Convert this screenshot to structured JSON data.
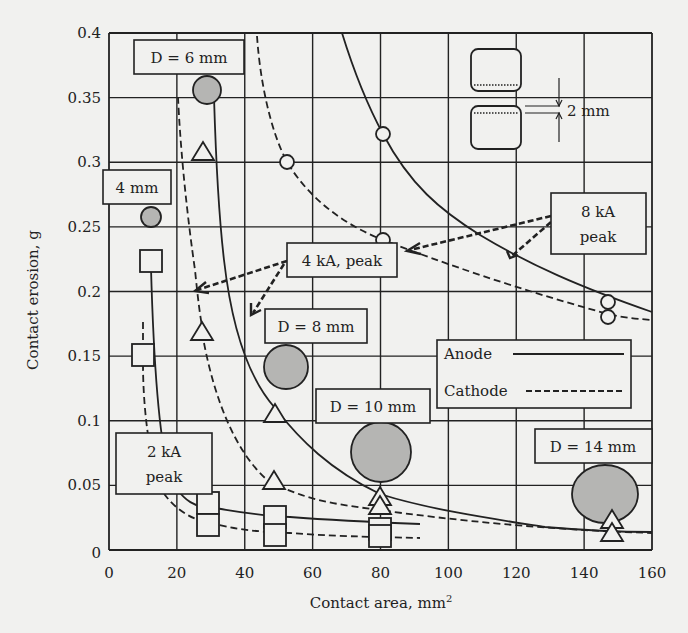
{
  "chart_data": {
    "type": "scatter",
    "title": "",
    "xlabel": "Contact area, mm²",
    "xlabel_main": "Contact area, mm",
    "xlabel_sup": "2",
    "ylabel": "Contact erosion, g",
    "xlim": [
      0,
      160
    ],
    "ylim": [
      0,
      0.4
    ],
    "grid": true,
    "x_ticks": [
      0,
      20,
      40,
      60,
      80,
      100,
      120,
      140,
      160
    ],
    "x_tick_labels": [
      "0",
      "20",
      "40",
      "60",
      "80",
      "100",
      "120",
      "140",
      "160"
    ],
    "y_ticks": [
      0,
      0.05,
      0.1,
      0.15,
      0.2,
      0.25,
      0.3,
      0.35,
      0.4
    ],
    "y_tick_labels": [
      "0",
      "0.05",
      "0.1",
      "0.15",
      "0.2",
      "0.25",
      "0.3",
      "0.35",
      "0.4"
    ],
    "legend": {
      "position": "center-right",
      "entries": [
        {
          "label": "Anode",
          "style": "solid"
        },
        {
          "label": "Cathode",
          "style": "dashed"
        }
      ]
    },
    "series": [
      {
        "name": "2 kA peak, Anode",
        "marker": "square",
        "line": "solid",
        "points": [
          [
            12.5,
            0.222
          ],
          [
            29,
            0.036
          ],
          [
            49,
            0.027
          ],
          [
            80,
            0.022
          ]
        ]
      },
      {
        "name": "2 kA peak, Cathode",
        "marker": "square",
        "line": "dashed",
        "points": [
          [
            10,
            0.15
          ],
          [
            29,
            0.019
          ],
          [
            49,
            0.013
          ],
          [
            80,
            0.012
          ]
        ]
      },
      {
        "name": "4 kA peak, Anode",
        "marker": "triangle",
        "line": "solid",
        "points": [
          [
            27.5,
            0.305
          ],
          [
            49,
            0.104
          ],
          [
            80,
            0.038
          ],
          [
            147,
            0.022
          ]
        ]
      },
      {
        "name": "4 kA peak, Cathode",
        "marker": "triangle",
        "line": "dashed",
        "points": [
          [
            27.5,
            0.167
          ],
          [
            48.5,
            0.052
          ],
          [
            80,
            0.032
          ],
          [
            147,
            0.012
          ]
        ]
      },
      {
        "name": "8 kA peak, Anode",
        "marker": "circle-open",
        "line": "solid",
        "points": [
          [
            80,
            0.32
          ],
          [
            147,
            0.19
          ]
        ]
      },
      {
        "name": "8 kA peak, Cathode",
        "marker": "circle-open",
        "line": "dashed",
        "points": [
          [
            52,
            0.298
          ],
          [
            80,
            0.24
          ],
          [
            147,
            0.18
          ]
        ]
      },
      {
        "name": "Electrode diameter markers",
        "marker": "circle-filled-gray",
        "points": [
          {
            "label": "4 mm",
            "x": 12.5,
            "y": 0.256
          },
          {
            "label": "D = 6 mm",
            "x": 29,
            "y": 0.354
          },
          {
            "label": "D = 8 mm",
            "x": 52,
            "y": 0.141
          },
          {
            "label": "D = 10 mm",
            "x": 80,
            "y": 0.075
          },
          {
            "label": "D = 14 mm",
            "x": 146,
            "y": 0.043
          }
        ]
      }
    ],
    "annotations": [
      {
        "text": "D = 6 mm"
      },
      {
        "text": "4 mm"
      },
      {
        "text": "4 kA, peak"
      },
      {
        "text": "8 kA peak"
      },
      {
        "text": "D = 8 mm"
      },
      {
        "text": "D = 10 mm"
      },
      {
        "text": "D = 14 mm"
      },
      {
        "text": "2 kA peak"
      },
      {
        "text": "2 mm",
        "note": "gap between contact electrodes inset"
      }
    ]
  },
  "labels": {
    "d6": "D = 6 mm",
    "d4": "4 mm",
    "d8": "D = 8 mm",
    "d10": "D = 10 mm",
    "d14": "D = 14 mm",
    "ka4": "4 kA, peak",
    "ka8_line1": "8 kA",
    "ka8_line2": "peak",
    "ka2_line1": "2 kA",
    "ka2_line2": "peak",
    "gap": "2 mm",
    "legend_anode": "Anode",
    "legend_cathode": "Cathode",
    "ylabel": "Contact erosion, g",
    "xlabel_main": "Contact area, mm",
    "xlabel_sup": "2"
  }
}
